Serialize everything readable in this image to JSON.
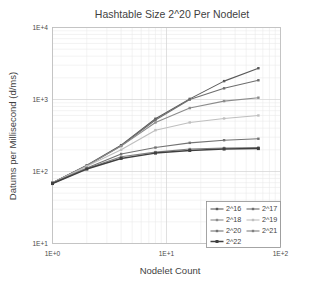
{
  "chart_data": {
    "type": "line",
    "title": "Hashtable Size 2^20 Per Nodelet",
    "xlabel": "Nodelet Count",
    "ylabel": "Datums per Millisecond (d/ms)",
    "xscale": "log",
    "yscale": "log",
    "xlim": [
      1,
      100
    ],
    "ylim": [
      10,
      10000
    ],
    "xticks": [
      1,
      10,
      100
    ],
    "xtick_labels": [
      "1E+0",
      "1E+1",
      "1E+2"
    ],
    "yticks": [
      10,
      100,
      1000,
      10000
    ],
    "ytick_labels": [
      "1E+1",
      "1E+2",
      "1E+3",
      "1E+4"
    ],
    "grid": true,
    "grid_minor": true,
    "legend_position": "lower-right",
    "x": [
      1,
      2,
      4,
      8,
      16,
      32,
      64
    ],
    "series": [
      {
        "name": "2^16",
        "color": "#595959",
        "marker": "square",
        "values": [
          70,
          122,
          232,
          540,
          1020,
          1800,
          2720
        ]
      },
      {
        "name": "2^17",
        "color": "#6e6e6e",
        "marker": "square",
        "values": [
          70,
          120,
          228,
          520,
          1000,
          1430,
          1850
        ]
      },
      {
        "name": "2^18",
        "color": "#8c8c8c",
        "marker": "square",
        "values": [
          70,
          120,
          225,
          480,
          760,
          950,
          1060
        ]
      },
      {
        "name": "2^19",
        "color": "#bfbfbf",
        "marker": "square",
        "values": [
          69,
          118,
          200,
          375,
          480,
          545,
          600
        ]
      },
      {
        "name": "2^20",
        "color": "#737373",
        "marker": "square",
        "values": [
          69,
          112,
          175,
          215,
          250,
          272,
          285
        ]
      },
      {
        "name": "2^21",
        "color": "#808080",
        "marker": "square",
        "values": [
          68,
          110,
          160,
          186,
          205,
          212,
          215
        ]
      },
      {
        "name": "2^22",
        "color": "#404040",
        "marker": "square",
        "values": [
          68,
          108,
          152,
          180,
          196,
          205,
          208
        ]
      }
    ],
    "legend_entries": [
      "2^16",
      "2^17",
      "2^18",
      "2^19",
      "2^20",
      "2^21",
      "2^22"
    ]
  },
  "colors": {
    "background": "#ffffff",
    "grid_major": "#d2d2d2",
    "grid_minor": "#e9e9e9",
    "frame": "#bdbdbd",
    "text": "#3f3f3f"
  }
}
